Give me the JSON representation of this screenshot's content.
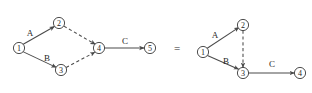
{
  "figure": {
    "type": "graph-equivalence-diagram",
    "equals_symbol": "=",
    "stroke_color": "#4a4a4a",
    "node_fill": "#ffffff",
    "background": "#ffffff"
  },
  "left_graph": {
    "name": "left-graph",
    "nodes": [
      {
        "id": "L1",
        "label": "1",
        "cx": 19,
        "cy": 48,
        "r": 5.6
      },
      {
        "id": "L2",
        "label": "2",
        "cx": 59,
        "cy": 23,
        "r": 5.6
      },
      {
        "id": "L3",
        "label": "3",
        "cx": 61,
        "cy": 70,
        "r": 5.6
      },
      {
        "id": "L4",
        "label": "4",
        "cx": 99,
        "cy": 48,
        "r": 5.6
      },
      {
        "id": "L5",
        "label": "5",
        "cx": 150,
        "cy": 48,
        "r": 5.6
      }
    ],
    "edges": [
      {
        "id": "L-e1",
        "from": "L1",
        "to": "L2",
        "style": "solid",
        "label": "A",
        "label_x": 30,
        "label_y": 33
      },
      {
        "id": "L-e2",
        "from": "L1",
        "to": "L3",
        "style": "solid",
        "label": "B",
        "label_x": 47,
        "label_y": 58
      },
      {
        "id": "L-e3",
        "from": "L2",
        "to": "L4",
        "style": "dashed",
        "label": "",
        "label_x": 0,
        "label_y": 0
      },
      {
        "id": "L-e4",
        "from": "L3",
        "to": "L4",
        "style": "dashed",
        "label": "",
        "label_x": 0,
        "label_y": 0
      },
      {
        "id": "L-e5",
        "from": "L4",
        "to": "L5",
        "style": "solid",
        "label": "C",
        "label_x": 125,
        "label_y": 41
      }
    ]
  },
  "right_graph": {
    "name": "right-graph",
    "nodes": [
      {
        "id": "R1",
        "label": "1",
        "cx": 203,
        "cy": 52,
        "r": 5.6
      },
      {
        "id": "R2",
        "label": "2",
        "cx": 243,
        "cy": 25,
        "r": 5.6
      },
      {
        "id": "R3",
        "label": "3",
        "cx": 243,
        "cy": 73,
        "r": 5.6
      },
      {
        "id": "R4",
        "label": "4",
        "cx": 300,
        "cy": 73,
        "r": 5.6
      }
    ],
    "edges": [
      {
        "id": "R-e1",
        "from": "R1",
        "to": "R2",
        "style": "solid",
        "label": "A",
        "label_x": 215,
        "label_y": 35
      },
      {
        "id": "R-e2",
        "from": "R1",
        "to": "R3",
        "style": "solid",
        "label": "B",
        "label_x": 226,
        "label_y": 61
      },
      {
        "id": "R-e3",
        "from": "R2",
        "to": "R3",
        "style": "dashed",
        "label": "",
        "label_x": 0,
        "label_y": 0
      },
      {
        "id": "R-e4",
        "from": "R3",
        "to": "R4",
        "style": "solid",
        "label": "C",
        "label_x": 272,
        "label_y": 64
      }
    ]
  },
  "equals": {
    "symbol": "=",
    "x": 177,
    "y": 48
  }
}
